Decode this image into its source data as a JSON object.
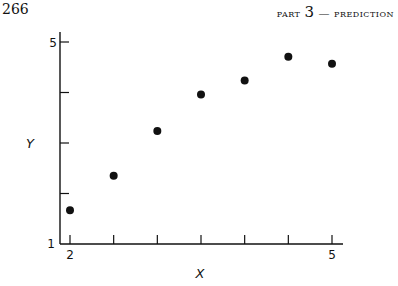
{
  "page": {
    "number": "266",
    "running_head_prefix": "part",
    "running_head_num": "3",
    "running_head_suffix": "— prediction"
  },
  "chart_data": {
    "type": "scatter",
    "title": "",
    "xlabel": "X",
    "ylabel": "Y",
    "xlim": [
      2,
      5
    ],
    "ylim": [
      1,
      5
    ],
    "x_tick_labels": [
      "2",
      "5"
    ],
    "y_tick_labels": [
      "1",
      "5"
    ],
    "x_ticks": [
      2,
      2.5,
      3,
      3.5,
      4,
      4.5,
      5
    ],
    "y_ticks": [
      1,
      2,
      3,
      4,
      5
    ],
    "grid": false,
    "legend": null,
    "points": [
      {
        "x": 2.0,
        "y": 1.67
      },
      {
        "x": 2.5,
        "y": 2.35
      },
      {
        "x": 3.0,
        "y": 3.24
      },
      {
        "x": 3.5,
        "y": 3.96
      },
      {
        "x": 4.0,
        "y": 4.24
      },
      {
        "x": 4.5,
        "y": 4.71
      },
      {
        "x": 5.0,
        "y": 4.57
      }
    ]
  }
}
